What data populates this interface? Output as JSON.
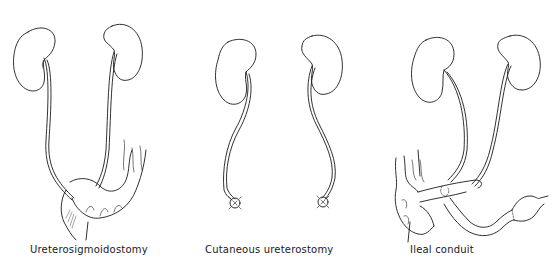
{
  "figure": {
    "panels": [
      {
        "id": "ureterosigmoidostomy",
        "caption": "Ureterosigmoidostomy"
      },
      {
        "id": "cutaneous-ureterostomy",
        "caption": "Cutaneous ureterostomy"
      },
      {
        "id": "ileal-conduit",
        "caption": "Ileal conduit"
      }
    ],
    "line_color": "#1a1a1a",
    "background": "#ffffff"
  }
}
